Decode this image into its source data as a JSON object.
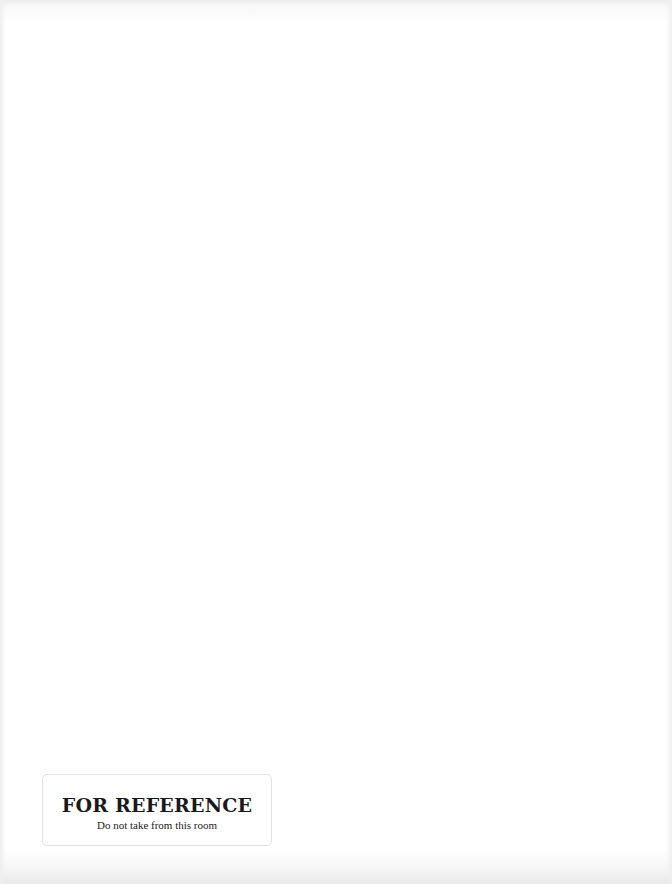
{
  "page": {
    "background": "#ffffff",
    "content": "blank"
  },
  "stamp": {
    "title": "FOR REFERENCE",
    "subtitle": "Do not take from this room",
    "text_color": "#1a1a1a",
    "border_color": "#e2e2e2"
  }
}
